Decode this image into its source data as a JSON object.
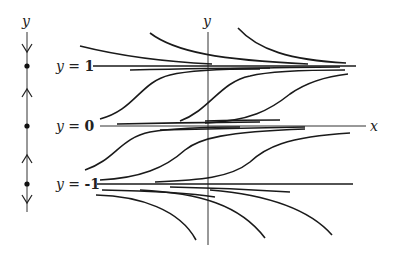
{
  "phase_line": {
    "axis_label": "y",
    "equilibria": [
      1,
      0,
      -1
    ],
    "arrows": [
      "down",
      "up",
      "up",
      "down"
    ]
  },
  "labels": {
    "eq_top": {
      "var": "y",
      "eq": " = ",
      "val": "1"
    },
    "eq_mid": {
      "var": "y",
      "eq": " = ",
      "val": "0"
    },
    "eq_bot": {
      "var": "y",
      "eq": " = ",
      "val": "-1"
    },
    "x_axis": "x",
    "y_axis": "y"
  },
  "colors": {
    "stroke": "#1a1a1a",
    "axis": "#333333",
    "background": "#ffffff"
  }
}
